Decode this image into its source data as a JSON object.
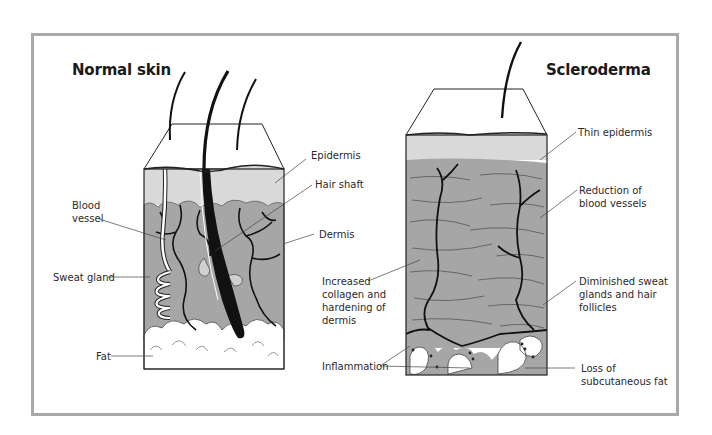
{
  "figure": {
    "panels": [
      {
        "id": "normal",
        "title": "Normal skin",
        "labels": {
          "epidermis": "Epidermis",
          "hair_shaft": "Hair shaft",
          "blood_vessel_line1": "Blood",
          "blood_vessel_line2": "vessel",
          "dermis": "Dermis",
          "sweat_gland": "Sweat gland",
          "fat": "Fat"
        }
      },
      {
        "id": "scleroderma",
        "title": "Scleroderma",
        "labels": {
          "thin_epidermis": "Thin epidermis",
          "reduction_line1": "Reduction of",
          "reduction_line2": "blood vessels",
          "collagen_line1": "Increased",
          "collagen_line2": "collagen and",
          "collagen_line3": "hardening of",
          "collagen_line4": "dermis",
          "diminished_line1": "Diminished sweat",
          "diminished_line2": "glands and hair",
          "diminished_line3": "follicles",
          "inflammation": "Inflammation",
          "fat_loss_line1": "Loss of",
          "fat_loss_line2": "subcutaneous fat"
        }
      }
    ],
    "colors": {
      "frame": "#a9a9a9",
      "epidermis": "#d9d9d9",
      "dermis": "#a6a6a6",
      "vessel": "#111111",
      "fat": "#ffffff",
      "text": "#2a2a2a"
    }
  }
}
